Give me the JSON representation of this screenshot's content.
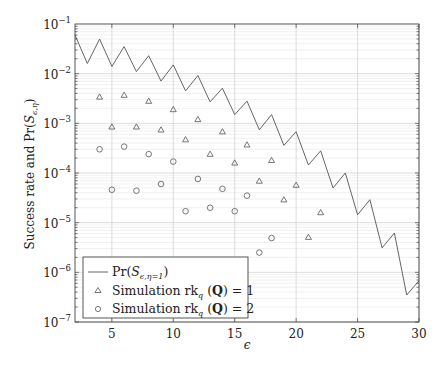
{
  "chart_data": {
    "type": "line",
    "title": "",
    "xlabel": "ϵ",
    "ylabel": "Success rate and Pr(S_{ϵ,η})",
    "xlim": [
      2,
      30
    ],
    "ylim": [
      1e-07,
      0.1
    ],
    "yscale": "log",
    "grid": {
      "x_major": true,
      "y_major": true,
      "y_minor": true
    },
    "x_ticks": [
      5,
      10,
      15,
      20,
      25,
      30
    ],
    "x_tick_labels": [
      "5",
      "10",
      "15",
      "20",
      "25",
      "30"
    ],
    "y_ticks": [
      0.1,
      0.01,
      0.001,
      0.0001,
      1e-05,
      1e-06,
      1e-07
    ],
    "y_tick_labels": [
      {
        "base": "10",
        "exp": "−1"
      },
      {
        "base": "10",
        "exp": "−2"
      },
      {
        "base": "10",
        "exp": "−3"
      },
      {
        "base": "10",
        "exp": "−4"
      },
      {
        "base": "10",
        "exp": "−5"
      },
      {
        "base": "10",
        "exp": "−6"
      },
      {
        "base": "10",
        "exp": "−7"
      }
    ],
    "legend_position": "lower left",
    "series": [
      {
        "name": "Pr(S_{ϵ,η=1})",
        "legend_label": "Pr(Sϵ,η=1)",
        "style": "line",
        "marker": "none",
        "color": "#555555",
        "x": [
          2,
          3,
          4,
          5,
          6,
          7,
          8,
          9,
          10,
          11,
          12,
          13,
          14,
          15,
          16,
          17,
          18,
          19,
          20,
          21,
          22,
          23,
          24,
          25,
          26,
          27,
          28,
          29,
          30
        ],
        "values": [
          0.06,
          0.016,
          0.05,
          0.014,
          0.035,
          0.011,
          0.023,
          0.0071,
          0.015,
          0.0045,
          0.0092,
          0.0027,
          0.0051,
          0.0015,
          0.0028,
          0.00074,
          0.0015,
          0.00036,
          0.00068,
          0.000145,
          0.00028,
          5e-05,
          0.0001,
          1.44e-05,
          2.9e-05,
          3.1e-06,
          6.2e-06,
          3.5e-07,
          6.8e-07
        ]
      },
      {
        "name": "Simulation rk_q(Q) = 1",
        "legend_label": "Simulation rkq (Q) = 1",
        "style": "markers",
        "marker": "triangle",
        "color": "#555555",
        "x": [
          4,
          5,
          6,
          7,
          8,
          9,
          10,
          11,
          12,
          13,
          14,
          15,
          16,
          17,
          18,
          19,
          20,
          21,
          22
        ],
        "values": [
          0.0034,
          0.00085,
          0.0037,
          0.00085,
          0.0028,
          0.00074,
          0.0019,
          0.00047,
          0.0012,
          0.00024,
          0.00068,
          0.00016,
          0.00037,
          6.9e-05,
          0.00018,
          2.9e-05,
          5.7e-05,
          5.1e-06,
          1.6e-05
        ]
      },
      {
        "name": "Simulation rk_q(Q) = 2",
        "legend_label": "Simulation rkq (Q) = 2",
        "style": "markers",
        "marker": "circle",
        "color": "#555555",
        "x": [
          4,
          5,
          6,
          7,
          8,
          9,
          10,
          11,
          12,
          13,
          14,
          15,
          16,
          17,
          18
        ],
        "values": [
          0.0003,
          4.6e-05,
          0.00034,
          4.4e-05,
          0.00024,
          6e-05,
          0.00017,
          1.7e-05,
          7.6e-05,
          2e-05,
          4.8e-05,
          1.7e-05,
          3.5e-05,
          2.5e-06,
          4.9e-06
        ]
      }
    ]
  },
  "legend": {
    "items": [
      {
        "prefix": "Pr(",
        "sym": "S",
        "sub": "ϵ,η=1",
        "suffix": ")"
      },
      {
        "text": "Simulation rk",
        "sub": "q",
        "rest": " (",
        "bold": "Q",
        "tail": ") = 1"
      },
      {
        "text": "Simulation rk",
        "sub": "q",
        "rest": " (",
        "bold": "Q",
        "tail": ") = 2"
      }
    ]
  },
  "axes": {
    "xlabel": "ϵ",
    "ylabel_prefix": "Success rate and Pr(",
    "ylabel_sym": "S",
    "ylabel_sub": "ϵ,η",
    "ylabel_suffix": ")"
  }
}
